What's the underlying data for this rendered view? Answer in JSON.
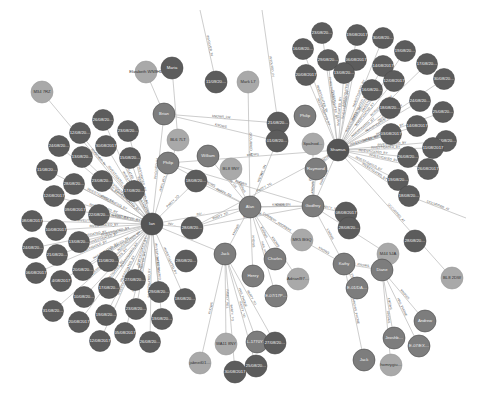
{
  "view": {
    "type": "graph",
    "background": "#ffffff",
    "colors": {
      "event_node": "#5c5c5c",
      "person_node": "#7d7d7d",
      "location_node": "#a9a9a9",
      "hub_node": "#555555",
      "edge": "#b8b8b8",
      "edge_label": "#555555"
    }
  },
  "hubs": [
    {
      "id": "ian",
      "label": "Ian",
      "x": 152,
      "y": 224,
      "r": 11,
      "kind": "hub"
    },
    {
      "id": "alan",
      "label": "Alan",
      "x": 250,
      "y": 207,
      "r": 11,
      "kind": "person"
    },
    {
      "id": "shamus",
      "label": "Shamus",
      "x": 338,
      "y": 150,
      "r": 11,
      "kind": "hub"
    },
    {
      "id": "godfrey",
      "label": "Godfrey",
      "x": 313,
      "y": 206,
      "r": 11,
      "kind": "person"
    },
    {
      "id": "jack",
      "label": "Jack",
      "x": 225,
      "y": 254,
      "r": 11,
      "kind": "person"
    },
    {
      "id": "kathy",
      "label": "Kathy",
      "x": 344,
      "y": 264,
      "r": 11,
      "kind": "person"
    },
    {
      "id": "diane",
      "label": "Diane",
      "x": 382,
      "y": 270,
      "r": 11,
      "kind": "person"
    }
  ],
  "nodes": [
    {
      "label": "M34 7RZ",
      "x": 42,
      "y": 92,
      "r": 11,
      "kind": "location"
    },
    {
      "label": "Elizabeth WN9HD",
      "x": 146,
      "y": 72,
      "r": 11,
      "kind": "location"
    },
    {
      "label": "Maria",
      "x": 172,
      "y": 68,
      "r": 11,
      "kind": "event"
    },
    {
      "label": "11/09/20…",
      "x": 216,
      "y": 82,
      "r": 11,
      "kind": "event"
    },
    {
      "label": "Mark L7",
      "x": 248,
      "y": 82,
      "r": 11,
      "kind": "location"
    },
    {
      "label": "Brian",
      "x": 164,
      "y": 114,
      "r": 11,
      "kind": "person"
    },
    {
      "label": "BL6 7LT",
      "x": 178,
      "y": 140,
      "r": 11,
      "kind": "location"
    },
    {
      "label": "Philip",
      "x": 168,
      "y": 163,
      "r": 11,
      "kind": "person"
    },
    {
      "label": "William",
      "x": 208,
      "y": 156,
      "r": 11,
      "kind": "person"
    },
    {
      "label": "BL8 9NY",
      "x": 231,
      "y": 169,
      "r": 11,
      "kind": "location"
    },
    {
      "label": "18/08/20…",
      "x": 196,
      "y": 181,
      "r": 11,
      "kind": "event"
    },
    {
      "label": "21/08/20…",
      "x": 278,
      "y": 123,
      "r": 11,
      "kind": "event"
    },
    {
      "label": "01/08/20…",
      "x": 277,
      "y": 141,
      "r": 11,
      "kind": "event"
    },
    {
      "label": "Philip",
      "x": 305,
      "y": 116,
      "r": 11,
      "kind": "person"
    },
    {
      "label": "Spalnod…",
      "x": 313,
      "y": 144,
      "r": 11,
      "kind": "location"
    },
    {
      "label": "Raymond",
      "x": 316,
      "y": 169,
      "r": 11,
      "kind": "person"
    },
    {
      "label": "MK5 BGQ",
      "x": 302,
      "y": 240,
      "r": 11,
      "kind": "location"
    },
    {
      "label": "Charles",
      "x": 275,
      "y": 259,
      "r": 11,
      "kind": "person"
    },
    {
      "label": "Henry",
      "x": 253,
      "y": 276,
      "r": 11,
      "kind": "person"
    },
    {
      "label": "Adrianl97…",
      "x": 298,
      "y": 279,
      "r": 11,
      "kind": "location"
    },
    {
      "label": "E-07/17P…",
      "x": 276,
      "y": 296,
      "r": 11,
      "kind": "person"
    },
    {
      "label": "WA11 8NY",
      "x": 226,
      "y": 344,
      "r": 11,
      "kind": "location"
    },
    {
      "label": "L-1770Y…",
      "x": 257,
      "y": 342,
      "r": 11,
      "kind": "person"
    },
    {
      "label": "27/08/20…",
      "x": 275,
      "y": 343,
      "r": 11,
      "kind": "event"
    },
    {
      "label": "jabneil01…",
      "x": 200,
      "y": 363,
      "r": 11,
      "kind": "location"
    },
    {
      "label": "30/08/2017",
      "x": 235,
      "y": 372,
      "r": 11,
      "kind": "event"
    },
    {
      "label": "25/08/20…",
      "x": 256,
      "y": 366,
      "r": 11,
      "kind": "event"
    },
    {
      "label": "28/08/20…",
      "x": 192,
      "y": 228,
      "r": 11,
      "kind": "event"
    },
    {
      "label": "28/08/20…",
      "x": 186,
      "y": 261,
      "r": 11,
      "kind": "event"
    },
    {
      "label": "M44 5JA",
      "x": 388,
      "y": 254,
      "r": 11,
      "kind": "location"
    },
    {
      "label": "28/08/20…",
      "x": 415,
      "y": 241,
      "r": 11,
      "kind": "event"
    },
    {
      "label": "BL8 2DW",
      "x": 452,
      "y": 278,
      "r": 11,
      "kind": "location"
    },
    {
      "label": "E-01/DA…",
      "x": 357,
      "y": 288,
      "r": 11,
      "kind": "person"
    },
    {
      "label": "Andrew",
      "x": 425,
      "y": 321,
      "r": 11,
      "kind": "person"
    },
    {
      "label": "Jeoshb…",
      "x": 394,
      "y": 338,
      "r": 11,
      "kind": "person"
    },
    {
      "label": "E-07/EX…",
      "x": 419,
      "y": 346,
      "r": 11,
      "kind": "person"
    },
    {
      "label": "Jack",
      "x": 364,
      "y": 360,
      "r": 11,
      "kind": "person"
    },
    {
      "label": "homrygiu…",
      "x": 391,
      "y": 365,
      "r": 11,
      "kind": "location"
    },
    {
      "label": "08/08/2017",
      "x": 346,
      "y": 213,
      "r": 11,
      "kind": "event"
    },
    {
      "label": "28/08/20…",
      "x": 349,
      "y": 228,
      "r": 11,
      "kind": "event"
    }
  ],
  "ian_cluster": [
    {
      "label": "26/08/20…",
      "x": 103,
      "y": 120
    },
    {
      "label": "12/08/20…",
      "x": 80,
      "y": 133
    },
    {
      "label": "23/08/20…",
      "x": 128,
      "y": 131
    },
    {
      "label": "24/08/20…",
      "x": 59,
      "y": 146
    },
    {
      "label": "30/08/2017",
      "x": 106,
      "y": 146
    },
    {
      "label": "13/08/20…",
      "x": 82,
      "y": 157
    },
    {
      "label": "15/08/20…",
      "x": 130,
      "y": 158
    },
    {
      "label": "11/08/20…",
      "x": 47,
      "y": 170
    },
    {
      "label": "28/08/20…",
      "x": 74,
      "y": 184
    },
    {
      "label": "23/08/20…",
      "x": 102,
      "y": 181
    },
    {
      "label": "17/08/20…",
      "x": 134,
      "y": 191
    },
    {
      "label": "12/08/2017",
      "x": 54,
      "y": 196
    },
    {
      "label": "09/08/2017",
      "x": 75,
      "y": 210
    },
    {
      "label": "22/08/20…",
      "x": 99,
      "y": 215
    },
    {
      "label": "08/08/2017",
      "x": 32,
      "y": 221
    },
    {
      "label": "10/08/2017",
      "x": 56,
      "y": 230
    },
    {
      "label": "13/08/20…",
      "x": 79,
      "y": 242
    },
    {
      "label": "24/08/20…",
      "x": 33,
      "y": 248
    },
    {
      "label": "21/08/20…",
      "x": 57,
      "y": 255
    },
    {
      "label": "11/08/20…",
      "x": 108,
      "y": 261
    },
    {
      "label": "20/08/20…",
      "x": 83,
      "y": 270
    },
    {
      "label": "06/08/2017",
      "x": 36,
      "y": 273
    },
    {
      "label": "4/08/2017",
      "x": 61,
      "y": 281
    },
    {
      "label": "17/08/20…",
      "x": 109,
      "y": 288
    },
    {
      "label": "27/08/20…",
      "x": 135,
      "y": 280
    },
    {
      "label": "29/08/20…",
      "x": 159,
      "y": 292
    },
    {
      "label": "10/08/20…",
      "x": 84,
      "y": 297
    },
    {
      "label": "31/08/20…",
      "x": 53,
      "y": 311
    },
    {
      "label": "23/08/20…",
      "x": 136,
      "y": 309
    },
    {
      "label": "19/08/20…",
      "x": 106,
      "y": 315
    },
    {
      "label": "20/08/2017",
      "x": 79,
      "y": 322
    },
    {
      "label": "05/08/2017",
      "x": 125,
      "y": 333
    },
    {
      "label": "19/08/20…",
      "x": 162,
      "y": 319
    },
    {
      "label": "12/08/2017",
      "x": 100,
      "y": 341
    },
    {
      "label": "26/08/20…",
      "x": 150,
      "y": 342
    },
    {
      "label": "18/08/20…",
      "x": 185,
      "y": 299
    }
  ],
  "shamus_cluster": [
    {
      "label": "23/08/20…",
      "x": 322,
      "y": 33
    },
    {
      "label": "19/08/2017",
      "x": 357,
      "y": 35
    },
    {
      "label": "30/08/20…",
      "x": 383,
      "y": 38
    },
    {
      "label": "16/08/20…",
      "x": 303,
      "y": 49
    },
    {
      "label": "29/08/20…",
      "x": 328,
      "y": 60
    },
    {
      "label": "06/08/2017",
      "x": 356,
      "y": 60
    },
    {
      "label": "19/08/20…",
      "x": 405,
      "y": 51
    },
    {
      "label": "20/08/2017",
      "x": 306,
      "y": 75
    },
    {
      "label": "13/08/20…",
      "x": 344,
      "y": 73
    },
    {
      "label": "14/08/2017",
      "x": 383,
      "y": 66
    },
    {
      "label": "17/08/20…",
      "x": 427,
      "y": 64
    },
    {
      "label": "16/08/20…",
      "x": 372,
      "y": 90
    },
    {
      "label": "12/08/2017",
      "x": 394,
      "y": 81
    },
    {
      "label": "30/08/20…",
      "x": 444,
      "y": 79
    },
    {
      "label": "18/08/20…",
      "x": 390,
      "y": 108
    },
    {
      "label": "24/08/20…",
      "x": 420,
      "y": 101
    },
    {
      "label": "25/08/20…",
      "x": 443,
      "y": 112
    },
    {
      "label": "14/08/2017",
      "x": 417,
      "y": 126
    },
    {
      "label": "03/08/2017",
      "x": 391,
      "y": 134
    },
    {
      "label": "24/08/20…",
      "x": 446,
      "y": 141
    },
    {
      "label": "11/08/2017",
      "x": 433,
      "y": 148
    },
    {
      "label": "26/08/20…",
      "x": 408,
      "y": 157
    },
    {
      "label": "26/08/2017",
      "x": 428,
      "y": 169
    },
    {
      "label": "19/08/20…",
      "x": 398,
      "y": 180
    },
    {
      "label": "18/08/20…",
      "x": 409,
      "y": 196
    }
  ],
  "edges_from_hubs": [
    {
      "from": "ian",
      "to": "alan",
      "label": "INV…"
    },
    {
      "from": "alan",
      "to": "godfrey",
      "label": "KNOWS_SN"
    },
    {
      "from": "alan",
      "to": "godfrey",
      "label": "KNOWS"
    },
    {
      "from": "alan",
      "to": "jack",
      "label": "KNOWS"
    },
    {
      "from": "godfrey",
      "to": "kathy",
      "label": "KNOWS"
    },
    {
      "from": "kathy",
      "to": "diane",
      "label": "KNOWS"
    },
    {
      "from": "shamus",
      "to": "godfrey",
      "label": "PARTY_TO"
    },
    {
      "from": "jack",
      "to": "ian",
      "label": "PAR…"
    }
  ],
  "edge_labels": {
    "ian_cluster": "INVESTIGATED_BY",
    "ian_party": "PARTY_TO",
    "ian_involved": "INVOLVED_IN",
    "shamus_cluster": "INVESTIGATED_BY",
    "knows_lw": "KNOWS_LW",
    "knows": "KNOWS",
    "knows_sn": "KNOWS_SN",
    "knows_phone": "KNOWS_PHONE",
    "occurred_at": "OCCURRED_AT",
    "has_phone": "HAS_PHONE",
    "current_address": "CURRENT_ADDRESS",
    "family_rel": "FAMILY_REL"
  }
}
